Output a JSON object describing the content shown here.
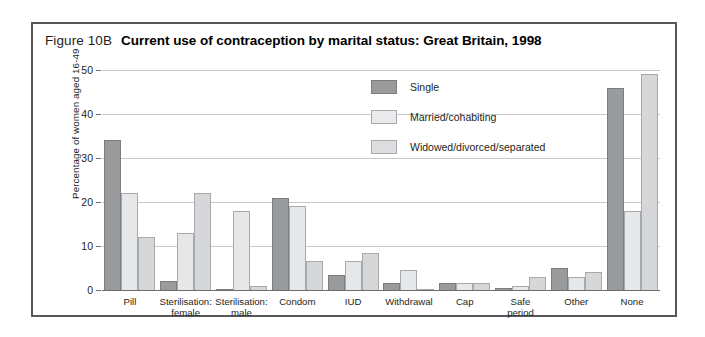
{
  "figure": {
    "number": "Figure 10B",
    "title": "Current use of contraception by marital status: Great Britain, 1998"
  },
  "chart_data": {
    "type": "bar",
    "title": "Current use of contraception by marital status: Great Britain, 1998",
    "xlabel": "",
    "ylabel": "Percentage of women aged 16-49",
    "ylim": [
      0,
      50
    ],
    "yticks": [
      0,
      10,
      20,
      30,
      40,
      50
    ],
    "grid": true,
    "legend_position": "inside-top-center",
    "categories": [
      "Pill",
      "Sterilisation:\nfemale",
      "Sterilisation:\nmale",
      "Condom",
      "IUD",
      "Withdrawal",
      "Cap",
      "Safe period",
      "Other",
      "None"
    ],
    "series": [
      {
        "name": "Single",
        "color": "#9a9b9d",
        "values": [
          34,
          2,
          0,
          21,
          3.5,
          1.5,
          1.5,
          0.5,
          5,
          46
        ]
      },
      {
        "name": "Married/cohabiting",
        "color": "#e6e7e8",
        "values": [
          22,
          13,
          18,
          19,
          6.5,
          4.5,
          1.5,
          1,
          3,
          18
        ]
      },
      {
        "name": "Widowed/divorced/separated",
        "color": "#d6d7d9",
        "values": [
          12,
          22,
          1,
          6.5,
          8.5,
          0,
          1.5,
          3,
          4,
          49
        ]
      }
    ]
  }
}
